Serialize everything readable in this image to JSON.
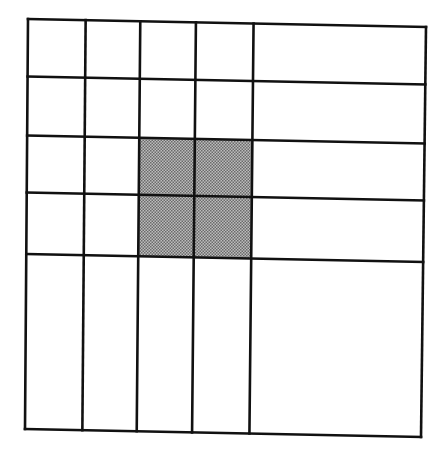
{
  "diagram": {
    "type": "grid",
    "rows": 5,
    "cols": 5,
    "line_color": "#111111",
    "shade_color": "#8a8a8a",
    "background": "#ffffff",
    "corners": {
      "top_left": [
        28,
        19
      ],
      "top_right": [
        426,
        27
      ],
      "bottom_left": [
        25,
        429
      ],
      "bottom_right": [
        421,
        437
      ]
    },
    "column_lines_top_x": [
      28,
      86,
      141,
      196,
      254,
      426
    ],
    "column_lines_bottom_x": [
      25,
      82,
      136,
      192,
      249,
      421
    ],
    "row_lines_left_y": [
      19,
      77,
      136,
      193,
      254,
      429
    ],
    "row_lines_right_y": [
      27,
      84,
      143,
      200,
      262,
      437
    ],
    "shaded_cells": [
      {
        "row": 2,
        "col": 2
      },
      {
        "row": 2,
        "col": 3
      },
      {
        "row": 3,
        "col": 2
      },
      {
        "row": 3,
        "col": 3
      }
    ]
  }
}
